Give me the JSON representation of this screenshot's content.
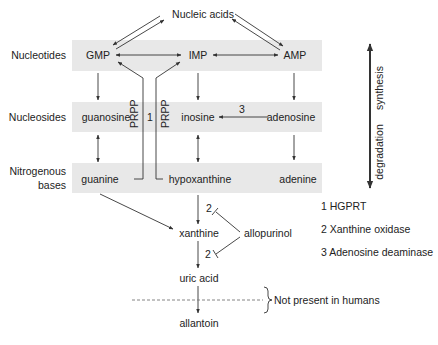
{
  "title_node": "Nucleic acids",
  "rows": {
    "nucleotides": {
      "label": "Nucleotides",
      "items": [
        "GMP",
        "IMP",
        "AMP"
      ]
    },
    "nucleosides": {
      "label": "Nucleosides",
      "items": [
        "guanosine",
        "inosine",
        "adenosine"
      ]
    },
    "bases": {
      "label_line1": "Nitrogenous",
      "label_line2": "bases",
      "items": [
        "guanine",
        "hypoxanthine",
        "adenine"
      ]
    }
  },
  "salvage": {
    "prpp_left": "PRPP",
    "prpp_right": "PRPP",
    "enzyme_num": "1"
  },
  "deamination_num": "3",
  "pathway": {
    "xanthine": "xanthine",
    "uric_acid": "uric acid",
    "allantoin": "allantoin",
    "inhibitor": "allopurinol",
    "enzyme_num_upper": "2",
    "enzyme_num_lower": "2",
    "not_present_note": "Not present in humans"
  },
  "direction": {
    "synthesis": "synthesis",
    "degradation": "degradation"
  },
  "legend": [
    "1 HGPRT",
    "2 Xanthine oxidase",
    "3 Adenosine deaminase"
  ],
  "colors": {
    "band": "#e8e8e8",
    "line": "#333333",
    "text": "#222222"
  }
}
